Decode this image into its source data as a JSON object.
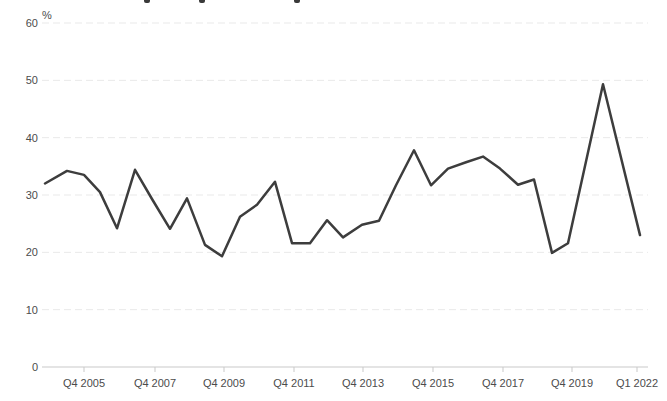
{
  "page": {
    "cropped_title": {
      "note": "title cut off at top edge; only letter descender tips visible",
      "descender_marks_x": [
        147,
        202,
        297
      ]
    }
  },
  "chart_data": {
    "type": "line",
    "title": "",
    "unit_label": "%",
    "xlabel": "",
    "ylabel": "%",
    "ylim": [
      0,
      60
    ],
    "y_ticks": [
      0,
      10,
      20,
      30,
      40,
      50,
      60
    ],
    "x_tick_labels": [
      "Q4 2005",
      "Q4 2007",
      "Q4 2009",
      "Q4 2011",
      "Q4 2013",
      "Q4 2015",
      "Q4 2017",
      "Q4 2019",
      "Q1 2022"
    ],
    "x_tick_px": [
      84,
      155,
      224,
      294,
      363,
      433,
      503,
      572,
      637
    ],
    "grid": "horizontal-dashed",
    "legend": "none",
    "series": [
      {
        "name": "share-of-respondents",
        "periods": [
          "Q4 2004",
          "Q2 2005",
          "Q4 2005",
          "Q2 2006",
          "Q4 2006",
          "Q2 2007",
          "Q4 2007",
          "Q2 2008",
          "Q4 2008",
          "Q2 2009",
          "Q4 2009",
          "Q2 2010",
          "Q4 2010",
          "Q2 2011",
          "Q4 2011",
          "Q2 2012",
          "Q4 2012",
          "Q2 2013",
          "Q4 2013",
          "Q2 2014",
          "Q4 2014",
          "Q2 2015",
          "Q4 2015",
          "Q2 2016",
          "Q4 2016",
          "Q2 2017",
          "Q4 2017",
          "Q2 2018",
          "Q4 2018",
          "Q2 2019",
          "Q4 2019",
          "Q4 2020",
          "Q1 2022"
        ],
        "values": [
          32.0,
          34.2,
          33.5,
          30.5,
          24.2,
          34.4,
          29.3,
          24.1,
          29.4,
          21.3,
          19.3,
          26.2,
          28.3,
          32.3,
          21.6,
          21.6,
          25.6,
          22.6,
          24.8,
          25.5,
          31.7,
          37.8,
          31.7,
          34.6,
          35.7,
          36.7,
          34.6,
          31.8,
          32.7,
          19.9,
          21.6,
          49.3,
          23.0
        ],
        "x_px": [
          45,
          67,
          84,
          100,
          117,
          135,
          152,
          170,
          187,
          205,
          222,
          240,
          257,
          275,
          292,
          310,
          327,
          343,
          362,
          379,
          396,
          414,
          431,
          448,
          466,
          483,
          500,
          518,
          534,
          552,
          568,
          603,
          640
        ]
      }
    ],
    "colors": {
      "line": "#3d3d3d",
      "axis": "#c9c9c9",
      "grid": "#e9e9e9",
      "text": "#4c4c4c",
      "background": "#ffffff"
    }
  }
}
